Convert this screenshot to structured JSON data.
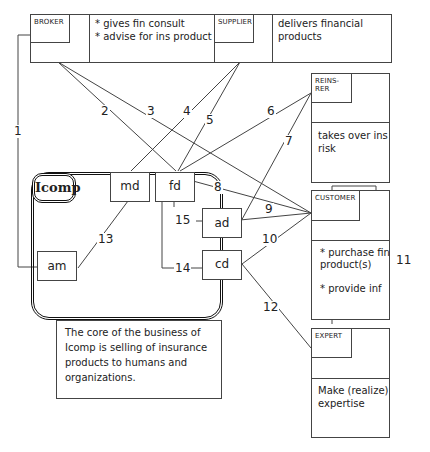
{
  "diagram": {
    "organization": {
      "name": "Icomp",
      "units": [
        {
          "id": "md",
          "label": "md"
        },
        {
          "id": "fd",
          "label": "fd"
        },
        {
          "id": "ad",
          "label": "ad"
        },
        {
          "id": "cd",
          "label": "cd"
        },
        {
          "id": "am",
          "label": "am"
        }
      ],
      "note": "The core of the business of Icomp is selling of insurance products to humans and organizations."
    },
    "actors": {
      "broker": {
        "tag": "BROKER",
        "description": "* gives fin consult\n* advise for ins product"
      },
      "supplier": {
        "tag": "SUPPLIER",
        "description": "delivers financial\nproducts"
      },
      "reinsurer": {
        "tag": "REINS-RER",
        "description": "takes over ins\nrisk"
      },
      "customer": {
        "tag": "CUSTOMER",
        "description": "* purchase fin\nproduct(s)\n\n* provide inf"
      },
      "expert": {
        "tag": "EXPERT",
        "description": "Make (realize)\nexpertise"
      }
    },
    "connections": [
      {
        "label": "1",
        "from": "BROKER",
        "to": "am"
      },
      {
        "label": "2",
        "from": "BROKER",
        "to": "fd"
      },
      {
        "label": "3",
        "from": "BROKER",
        "to": "CUSTOMER"
      },
      {
        "label": "4",
        "from": "SUPPLIER",
        "to": "md"
      },
      {
        "label": "5",
        "from": "SUPPLIER",
        "to": "fd"
      },
      {
        "label": "6",
        "from": "REINS-RER",
        "to": "fd"
      },
      {
        "label": "7",
        "from": "REINS-RER",
        "to": "ad"
      },
      {
        "label": "8",
        "from": "fd",
        "to": "CUSTOMER"
      },
      {
        "label": "9",
        "from": "ad",
        "to": "CUSTOMER"
      },
      {
        "label": "10",
        "from": "cd",
        "to": "CUSTOMER"
      },
      {
        "label": "11",
        "from": "CUSTOMER",
        "to": "EXPERT"
      },
      {
        "label": "12",
        "from": "cd",
        "to": "EXPERT"
      },
      {
        "label": "13",
        "from": "md",
        "to": "am"
      },
      {
        "label": "14",
        "from": "fd",
        "to": "cd"
      },
      {
        "label": "15",
        "from": "fd",
        "to": "ad"
      }
    ],
    "colors": {
      "line": "#444444",
      "background": "#ffffff",
      "text": "#222222"
    }
  }
}
